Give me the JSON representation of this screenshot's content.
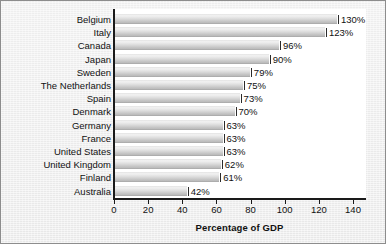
{
  "chart_data": {
    "type": "bar",
    "orientation": "horizontal",
    "title": "",
    "xlabel": "Percentage of GDP",
    "ylabel": "",
    "categories": [
      "Belgium",
      "Italy",
      "Canada",
      "Japan",
      "Sweden",
      "The Netherlands",
      "Spain",
      "Denmark",
      "Germany",
      "France",
      "United States",
      "United Kingdom",
      "Finland",
      "Australia"
    ],
    "values": [
      130,
      123,
      96,
      90,
      79,
      75,
      73,
      70,
      63,
      63,
      63,
      62,
      61,
      42
    ],
    "value_labels": [
      "130%",
      "123%",
      "96%",
      "90%",
      "79%",
      "75%",
      "73%",
      "70%",
      "63%",
      "63%",
      "63%",
      "62%",
      "61%",
      "42%"
    ],
    "xlim": [
      0,
      148
    ],
    "xticks": [
      0,
      20,
      40,
      60,
      80,
      100,
      120,
      140
    ],
    "xtick_labels": [
      "0",
      "20",
      "40",
      "60",
      "80",
      "100",
      "120",
      "140"
    ],
    "grid": false,
    "legend": null,
    "bar_color": "#dcdcdc",
    "axis_color": "#1a1a1a",
    "plot_background": "#ffffff",
    "figure_background": "#ededed"
  }
}
